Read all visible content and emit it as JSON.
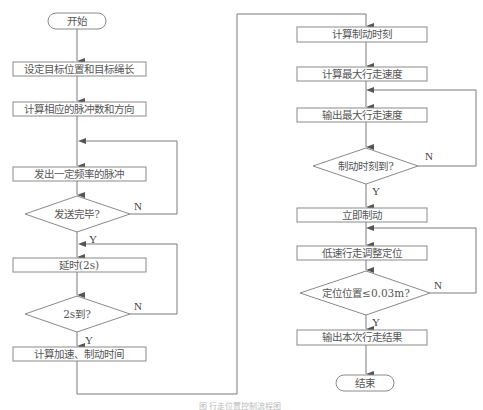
{
  "title": "行走位置控制流程图",
  "caption": "图 行走位置控制流程图",
  "colors": {
    "stroke": "#8a8a8a",
    "text": "#555555",
    "background": "#ffffff"
  },
  "left_column": {
    "start": "开始",
    "step_set_target": "设定目标位置和目标绳长",
    "step_calc_pulses": "计算相应的脉冲数和方向",
    "step_send_pulses": "发出一定频率的脉冲",
    "decision_sent": "发送完毕?",
    "step_delay": "延时(2s)",
    "decision_2s": "2s到?",
    "step_calc_times": "计算加速、制动时间"
  },
  "right_column": {
    "step_calc_brake_time": "计算制动时刻",
    "step_calc_max_speed": "计算最大行走速度",
    "step_output_max_speed": "输出最大行走速度",
    "decision_brake_time": "制动时刻到?",
    "step_brake": "立即制动",
    "step_low_speed_adjust": "低速行走调整定位",
    "decision_position": "定位位置≤0.03m?",
    "step_output_result": "输出本次行走结果",
    "end": "结束"
  },
  "labels": {
    "yes": "Y",
    "no": "N"
  }
}
